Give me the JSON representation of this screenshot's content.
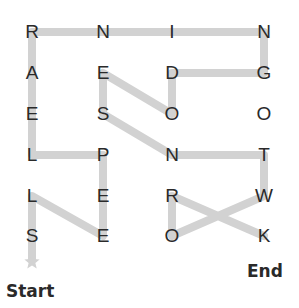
{
  "puzzle": {
    "grid": [
      [
        "R",
        "N",
        "I",
        "N"
      ],
      [
        "A",
        "E",
        "D",
        "G"
      ],
      [
        "E",
        "S",
        "O",
        "O"
      ],
      [
        "L",
        "P",
        "N",
        "T"
      ],
      [
        "L",
        "E",
        "R",
        "W"
      ],
      [
        "S",
        "E",
        "O",
        "K"
      ]
    ],
    "path": [
      [
        0,
        5
      ],
      [
        0,
        4
      ],
      [
        1,
        5
      ],
      [
        1,
        4
      ],
      [
        1,
        3
      ],
      [
        0,
        3
      ],
      [
        0,
        2
      ],
      [
        0,
        1
      ],
      [
        0,
        0
      ],
      [
        1,
        0
      ],
      [
        2,
        0
      ],
      [
        3,
        0
      ],
      [
        3,
        1
      ],
      [
        2,
        1
      ],
      [
        2,
        2
      ],
      [
        1,
        1
      ],
      [
        1,
        2
      ],
      [
        2,
        3
      ],
      [
        3,
        3
      ],
      [
        3,
        4
      ],
      [
        2,
        5
      ],
      [
        2,
        4
      ],
      [
        3,
        5
      ]
    ],
    "start_label": "Start",
    "end_label": "End",
    "path_color": "#d2d2d2",
    "letter_color": "#2a2a2a"
  }
}
